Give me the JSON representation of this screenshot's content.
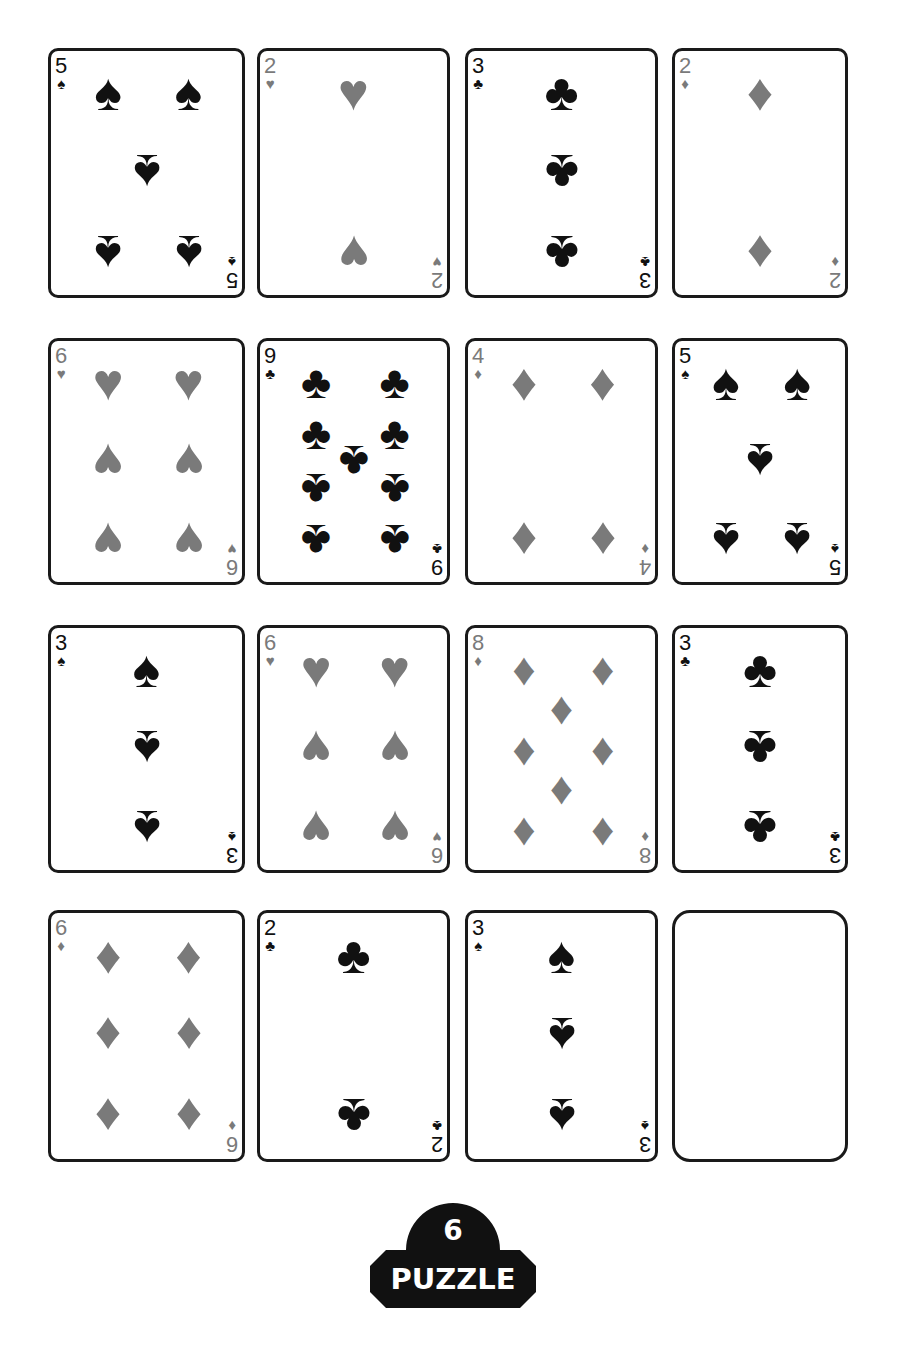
{
  "puzzle": {
    "number": "6",
    "label": "PUZZLE"
  },
  "colors": {
    "black_suit": "#111111",
    "red_suit": "#7a7a7a",
    "card_border": "#1a1a1a",
    "badge_bg": "#111111"
  },
  "suit_glyphs": {
    "spades": "♠",
    "hearts": "♥",
    "diamonds": "♦",
    "clubs": "♣"
  },
  "cards": [
    {
      "row": 1,
      "col": 1,
      "rank": "5",
      "suit": "spades",
      "color": "black"
    },
    {
      "row": 1,
      "col": 2,
      "rank": "2",
      "suit": "hearts",
      "color": "red"
    },
    {
      "row": 1,
      "col": 3,
      "rank": "3",
      "suit": "clubs",
      "color": "black"
    },
    {
      "row": 1,
      "col": 4,
      "rank": "2",
      "suit": "diamonds",
      "color": "red"
    },
    {
      "row": 2,
      "col": 1,
      "rank": "6",
      "suit": "hearts",
      "color": "red"
    },
    {
      "row": 2,
      "col": 2,
      "rank": "9",
      "suit": "clubs",
      "color": "black"
    },
    {
      "row": 2,
      "col": 3,
      "rank": "4",
      "suit": "diamonds",
      "color": "red"
    },
    {
      "row": 2,
      "col": 4,
      "rank": "5",
      "suit": "spades",
      "color": "black"
    },
    {
      "row": 3,
      "col": 1,
      "rank": "3",
      "suit": "spades",
      "color": "black"
    },
    {
      "row": 3,
      "col": 2,
      "rank": "6",
      "suit": "hearts",
      "color": "red"
    },
    {
      "row": 3,
      "col": 3,
      "rank": "8",
      "suit": "diamonds",
      "color": "red"
    },
    {
      "row": 3,
      "col": 4,
      "rank": "3",
      "suit": "clubs",
      "color": "black"
    },
    {
      "row": 4,
      "col": 1,
      "rank": "6",
      "suit": "diamonds",
      "color": "red"
    },
    {
      "row": 4,
      "col": 2,
      "rank": "2",
      "suit": "clubs",
      "color": "black"
    },
    {
      "row": 4,
      "col": 3,
      "rank": "3",
      "suit": "spades",
      "color": "black"
    },
    {
      "row": 4,
      "col": 4,
      "rank": "",
      "suit": "",
      "color": "",
      "empty": true
    }
  ]
}
